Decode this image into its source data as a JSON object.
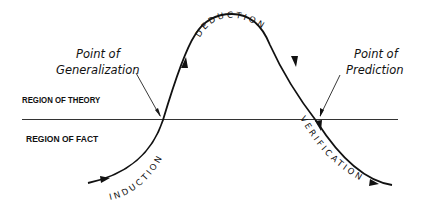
{
  "diagram": {
    "regions": {
      "theory": "REGION OF THEORY",
      "fact": "REGION OF FACT"
    },
    "points": {
      "generalization": {
        "line1": "Point of",
        "line2": "Generalization"
      },
      "prediction": {
        "line1": "Point of",
        "line2": "Prediction"
      }
    },
    "stages": {
      "induction": "INDUCTION",
      "deduction": "DEDUCTION",
      "verification": "VERIFICATION"
    },
    "colors": {
      "ink": "#111111",
      "divider": "#333333",
      "background": "#ffffff"
    }
  }
}
